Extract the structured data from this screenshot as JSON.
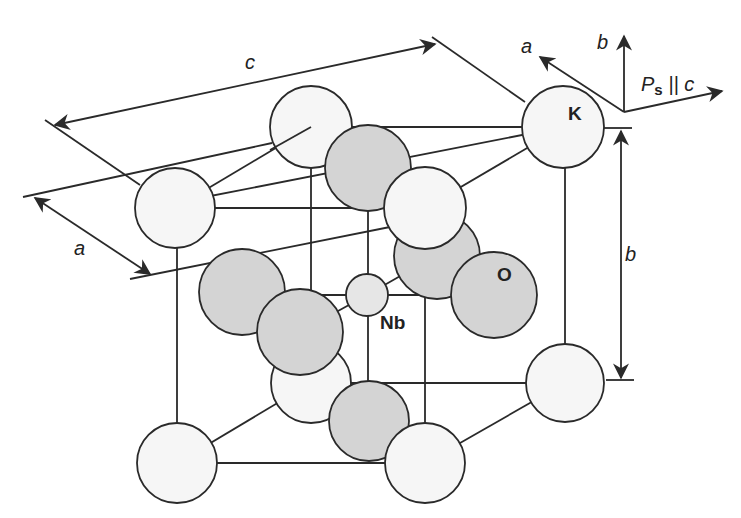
{
  "figure": {
    "labels": {
      "dim_c": "c",
      "dim_a": "a",
      "dim_b": "b",
      "atom_k": "K",
      "atom_o": "O",
      "atom_nb": "Nb",
      "axis_a": "a",
      "axis_b": "b",
      "axis_ps_prefix": "P",
      "axis_ps_sub": "s",
      "axis_ps_suffix": " || c"
    },
    "colors": {
      "k_fill": "#f6f6f6",
      "o_fill": "#d4d4d4",
      "nb_fill": "#e6e6e6",
      "stroke": "#2a2a2a"
    }
  }
}
